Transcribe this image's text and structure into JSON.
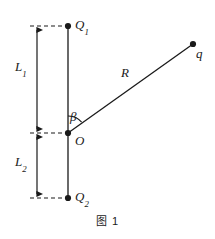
{
  "figure": {
    "caption": "图 1",
    "labels": {
      "charge_top": "Q",
      "charge_top_sub": "1",
      "charge_bottom": "Q",
      "charge_bottom_sub": "2",
      "origin": "O",
      "test_charge": "q",
      "distance": "R",
      "angle": "β",
      "length_upper": "L",
      "length_upper_sub": "1",
      "length_lower": "L",
      "length_lower_sub": "2"
    },
    "colors": {
      "stroke": "#1a1a1a",
      "background": "#ffffff"
    },
    "geometry": {
      "points": {
        "Q1": [
          68,
          26
        ],
        "O": [
          68,
          133
        ],
        "Q2": [
          68,
          198
        ],
        "q": [
          193,
          44
        ]
      },
      "dimension_axis_x": 37,
      "angle_arc_radius": 17
    }
  }
}
